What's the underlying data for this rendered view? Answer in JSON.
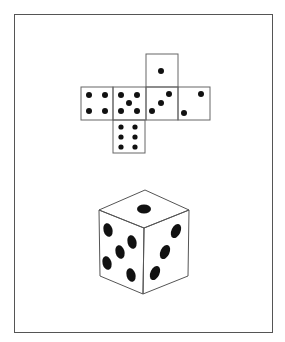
{
  "figure": {
    "description": "Net of a die (unfolded cube) and the assembled die",
    "net": {
      "faces": [
        {
          "position": "top",
          "pips": 1
        },
        {
          "position": "row-1",
          "pips": 4
        },
        {
          "position": "row-2",
          "pips": 5
        },
        {
          "position": "row-3",
          "pips": 3
        },
        {
          "position": "row-4",
          "pips": 2
        },
        {
          "position": "bottom",
          "pips": 6
        }
      ]
    },
    "die": {
      "visible_faces": [
        {
          "face": "top",
          "pips": 1
        },
        {
          "face": "left",
          "pips": 5
        },
        {
          "face": "right",
          "pips": 3
        }
      ]
    },
    "colors": {
      "line": "#555555",
      "pip": "#111111",
      "background": "#ffffff"
    }
  }
}
